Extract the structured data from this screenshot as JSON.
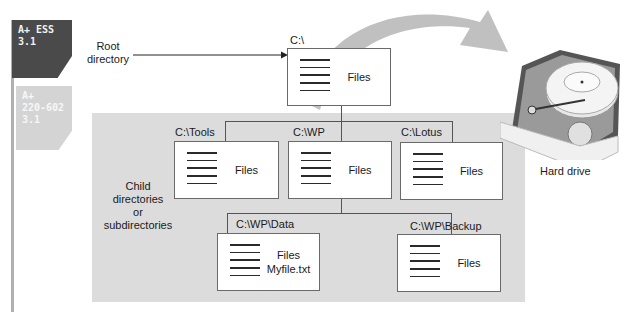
{
  "badges": [
    {
      "line1": "A+ ESS",
      "line2": "3.1",
      "color": "#4a4a4a"
    },
    {
      "line1": "A+",
      "line2": "220-602",
      "line3": "3.1",
      "color": "#d4d4d4"
    }
  ],
  "labels": {
    "root_line1": "Root",
    "root_line2": "directory",
    "child_line1": "Child",
    "child_line2": "directories",
    "child_line3": "or",
    "child_line4": "subdirectories",
    "hard_drive": "Hard drive"
  },
  "directories": {
    "root": {
      "path": "C:\\",
      "content": "Files"
    },
    "tools": {
      "path": "C:\\Tools",
      "content": "Files"
    },
    "wp": {
      "path": "C:\\WP",
      "content": "Files"
    },
    "lotus": {
      "path": "C:\\Lotus",
      "content": "Files"
    },
    "wp_data": {
      "path": "C:\\WP\\Data",
      "content": "Files",
      "file": "Myfile.txt"
    },
    "wp_backup": {
      "path": "C:\\WP\\Backup",
      "content": "Files"
    }
  },
  "colors": {
    "panel": "#dcdcdc",
    "arrow": "#bdbdbd",
    "box_border": "#6a6a6a"
  }
}
